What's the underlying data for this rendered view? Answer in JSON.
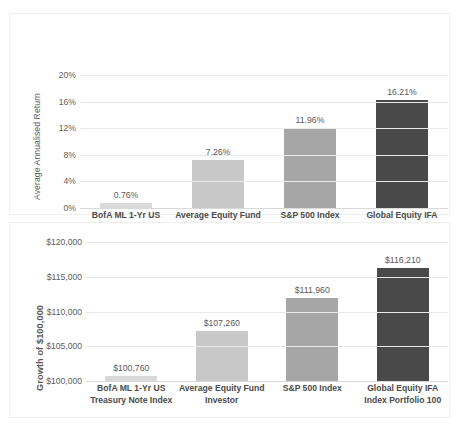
{
  "chart_data": [
    {
      "type": "bar",
      "title": "",
      "xlabel": "",
      "ylabel": "Average Annualised Return",
      "categories": [
        "BofA ML 1-Yr US Treasury Note Index",
        "Average Equity Fund Investor",
        "S&P 500 Index",
        "Global Equity IFA Index Portfolio 100"
      ],
      "category_lines": [
        [
          "BofA ML 1-Yr US",
          "Treasury Note Index"
        ],
        [
          "Average Equity Fund",
          "Investor"
        ],
        [
          "S&P 500 Index"
        ],
        [
          "Global Equity IFA",
          "Index Portfolio 100"
        ]
      ],
      "values": [
        0.76,
        7.26,
        11.96,
        16.21
      ],
      "data_labels": [
        "0.76%",
        "7.26%",
        "11.96%",
        "16.21%"
      ],
      "bar_colors": [
        "#d9d9d9",
        "#c8c8c8",
        "#a6a6a6",
        "#494949"
      ],
      "ylim": [
        0,
        20
      ],
      "yticks": [
        0,
        4,
        8,
        12,
        16,
        20
      ],
      "ytick_labels": [
        "0%",
        "4%",
        "8%",
        "12%",
        "16%",
        "20%"
      ],
      "grid": true,
      "legend": "none"
    },
    {
      "type": "bar",
      "title": "",
      "xlabel": "",
      "ylabel": "Growth of $100,000",
      "categories": [
        "BofA ML 1-Yr US Treasury Note Index",
        "Average Equity Fund Investor",
        "S&P 500 Index",
        "Global Equity IFA Index Portfolio 100"
      ],
      "category_lines": [
        [
          "BofA ML 1-Yr US",
          "Treasury Note Index"
        ],
        [
          "Average Equity Fund",
          "Investor"
        ],
        [
          "S&P 500 Index"
        ],
        [
          "Global Equity IFA",
          "Index Portfolio 100"
        ]
      ],
      "values": [
        100760,
        107260,
        111960,
        116210
      ],
      "data_labels": [
        "$100,760",
        "$107,260",
        "$111,960",
        "$116,210"
      ],
      "bar_colors": [
        "#d9d9d9",
        "#c8c8c8",
        "#a6a6a6",
        "#494949"
      ],
      "ylim": [
        100000,
        120000
      ],
      "yticks": [
        100000,
        105000,
        110000,
        115000,
        120000
      ],
      "ytick_labels": [
        "$100,000",
        "$105,000",
        "$110,000",
        "$115,000",
        "$120,000"
      ],
      "grid": true,
      "legend": "none"
    }
  ]
}
